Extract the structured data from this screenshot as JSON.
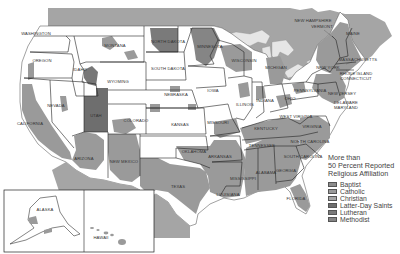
{
  "map": {
    "title": "More than 50 Percent Reported Religious Affiliation",
    "state_labels": [
      {
        "name": "WASHINGTON",
        "x": 36,
        "y": 35
      },
      {
        "name": "OREGON",
        "x": 42,
        "y": 62
      },
      {
        "name": "CALIFORNIA",
        "x": 30,
        "y": 125
      },
      {
        "name": "NEVADA",
        "x": 56,
        "y": 107
      },
      {
        "name": "IDAHO",
        "x": 80,
        "y": 71
      },
      {
        "name": "MONTANA",
        "x": 115,
        "y": 47
      },
      {
        "name": "WYOMING",
        "x": 118,
        "y": 83
      },
      {
        "name": "UTAH",
        "x": 96,
        "y": 117
      },
      {
        "name": "COLORADO",
        "x": 136,
        "y": 122
      },
      {
        "name": "ARIZONA",
        "x": 84,
        "y": 160
      },
      {
        "name": "NEW MEXICO",
        "x": 124,
        "y": 163
      },
      {
        "name": "NORTH DAKOTA",
        "x": 168,
        "y": 43
      },
      {
        "name": "SOUTH DAKOTA",
        "x": 168,
        "y": 70
      },
      {
        "name": "NEBRASKA",
        "x": 176,
        "y": 96
      },
      {
        "name": "KANSAS",
        "x": 180,
        "y": 126
      },
      {
        "name": "OKLAHOMA",
        "x": 194,
        "y": 153
      },
      {
        "name": "TEXAS",
        "x": 178,
        "y": 188
      },
      {
        "name": "MINNESOTA",
        "x": 210,
        "y": 48
      },
      {
        "name": "IOWA",
        "x": 213,
        "y": 92
      },
      {
        "name": "MISSOURI",
        "x": 218,
        "y": 124
      },
      {
        "name": "ARKANSAS",
        "x": 220,
        "y": 158
      },
      {
        "name": "LOUISIANA",
        "x": 228,
        "y": 196
      },
      {
        "name": "WISCONSIN",
        "x": 244,
        "y": 62
      },
      {
        "name": "ILLINOIS",
        "x": 245,
        "y": 106
      },
      {
        "name": "MICHIGAN",
        "x": 276,
        "y": 69
      },
      {
        "name": "INDIANA",
        "x": 265,
        "y": 102
      },
      {
        "name": "OHIO",
        "x": 290,
        "y": 100
      },
      {
        "name": "KENTUCKY",
        "x": 266,
        "y": 130
      },
      {
        "name": "TENNESSEE",
        "x": 262,
        "y": 147
      },
      {
        "name": "MISSISSIPPI",
        "x": 243,
        "y": 180
      },
      {
        "name": "ALABAMA",
        "x": 266,
        "y": 174
      },
      {
        "name": "GEORGIA",
        "x": 286,
        "y": 172
      },
      {
        "name": "FLORIDA",
        "x": 296,
        "y": 200
      },
      {
        "name": "SOUTH CAROLINA",
        "x": 303,
        "y": 158
      },
      {
        "name": "NORTH CAROLINA",
        "x": 310,
        "y": 143
      },
      {
        "name": "VIRGINIA",
        "x": 312,
        "y": 128
      },
      {
        "name": "WEST VIRGINIA",
        "x": 296,
        "y": 118
      },
      {
        "name": "PENNSYLVANIA",
        "x": 310,
        "y": 92
      },
      {
        "name": "NEW YORK",
        "x": 328,
        "y": 69
      },
      {
        "name": "NEW JERSEY",
        "x": 342,
        "y": 95
      },
      {
        "name": "DELAWARE",
        "x": 346,
        "y": 104
      },
      {
        "name": "MARYLAND",
        "x": 346,
        "y": 109
      },
      {
        "name": "NEW HAMPSHIRE",
        "x": 313,
        "y": 22
      },
      {
        "name": "VERMONT",
        "x": 322,
        "y": 28
      },
      {
        "name": "MAINE",
        "x": 353,
        "y": 35
      },
      {
        "name": "MASSACHUSETTS",
        "x": 358,
        "y": 61
      },
      {
        "name": "RHODE ISLAND",
        "x": 356,
        "y": 75
      },
      {
        "name": "CONNECTICUT",
        "x": 356,
        "y": 80
      },
      {
        "name": "ALASKA",
        "x": 45,
        "y": 211
      },
      {
        "name": "HAWAII",
        "x": 101,
        "y": 239
      }
    ]
  },
  "legend": {
    "title_lines": [
      "More than",
      "50 Percent Reported",
      "Religious Affiliation"
    ],
    "items": [
      {
        "label": "Baptist",
        "color": "#8c8c8c"
      },
      {
        "label": "Catholic",
        "color": "#9a9a9a"
      },
      {
        "label": "Christian",
        "color": "#a6a6a6"
      },
      {
        "label": "Latter-Day Saints",
        "color": "#6e6e6e"
      },
      {
        "label": "Lutheran",
        "color": "#7a7a7a"
      },
      {
        "label": "Methodist",
        "color": "#858585"
      }
    ]
  },
  "colors": {
    "background": "#ffffff",
    "land_unaffiliated": "#ffffff",
    "canada_mexico": "#a2a2a2",
    "water": "#ebebeb",
    "baptist": "#8c8c8c",
    "catholic": "#9a9a9a",
    "lds": "#6e6e6e",
    "lutheran": "#7a7a7a",
    "border": "#222222"
  }
}
